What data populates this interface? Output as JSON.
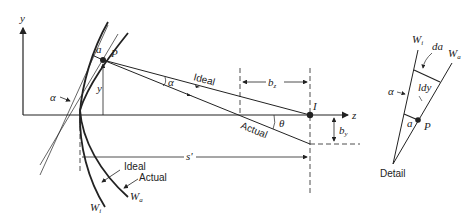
{
  "diagram": {
    "axes": {
      "y_label": "y",
      "z_label": "z"
    },
    "points": {
      "P": "P",
      "a": "a",
      "I": "I"
    },
    "rays": {
      "ideal": "Ideal",
      "actual": "Actual"
    },
    "angles": {
      "alpha_left": "α",
      "alpha_ray": "α",
      "theta": "θ"
    },
    "dimensions": {
      "y": "y",
      "bz": "b",
      "bz_sub": "z",
      "by": "b",
      "by_sub": "y",
      "s_prime": "s'"
    },
    "wavefronts": {
      "ideal_label": "Ideal",
      "actual_label": "Actual",
      "Wi": "W",
      "Wi_sub": "i",
      "Wa": "W",
      "Wa_sub": "a"
    },
    "detail": {
      "title": "Detail",
      "Wi": "W",
      "Wi_sub": "i",
      "Wa": "W",
      "Wa_sub": "a",
      "da": "da",
      "ldy": "ldy",
      "alpha": "α",
      "a": "a",
      "P": "P"
    },
    "colors": {
      "ink": "#222222",
      "background": "#ffffff"
    }
  }
}
